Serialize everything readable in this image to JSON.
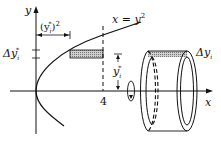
{
  "figure": {
    "axes": {
      "x_label": "x",
      "y_label": "y"
    },
    "curve": {
      "equation_lhs": "x",
      "equation_eq": " = ",
      "equation_rhs_base": "y",
      "equation_rhs_exp": "2"
    },
    "markers": {
      "x_tick_value": "4"
    },
    "annotations": {
      "radius_label_base": "(y",
      "radius_label_sub": "i",
      "radius_label_star": "*",
      "radius_label_close": ")",
      "radius_label_exp": "2",
      "delta_left_prefix": "Δy",
      "delta_left_sub": "i",
      "delta_left_star": "*",
      "height_label_base": "y",
      "height_label_sub": "i",
      "height_label_star": "*",
      "delta_right_prefix": "Δy",
      "delta_right_sub": "i"
    },
    "colors": {
      "line": "#111111",
      "shading": "#9a9a9a",
      "background": "#ffffff"
    }
  }
}
